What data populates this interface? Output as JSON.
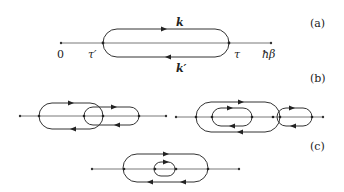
{
  "panels": {
    "a": {
      "label": "(a)",
      "axis_start": "0",
      "axis_end": "ħβ",
      "left_vertex": "τ′",
      "right_vertex": "τ",
      "upper_line": "k",
      "lower_line": "k′"
    },
    "b": {
      "label": "(b)"
    },
    "c": {
      "label": "(c)"
    }
  }
}
